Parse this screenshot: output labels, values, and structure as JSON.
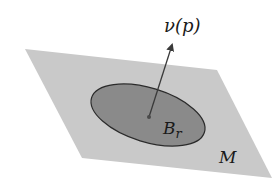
{
  "figure": {
    "type": "tangent-plane-normal-diagram",
    "labels": {
      "normal": "ν(p)",
      "ball_main": "B",
      "ball_sub": "r",
      "manifold": "M"
    },
    "colors": {
      "background": "#ffffff",
      "plane_fill": "#c9c9c9",
      "ball_fill": "#8a8a8a",
      "ball_stroke": "#2b2b2b",
      "arrow": "#3a3a3a",
      "text": "#1a1a1a"
    },
    "elements": {
      "plane": {
        "points": "25,49 217,70 272,178 82,158"
      },
      "ball": {
        "cx": 148,
        "cy": 115,
        "rx": 59,
        "ry": 27,
        "rotate": 17
      },
      "point_p": {
        "cx": 149,
        "cy": 117,
        "r": 2
      },
      "normal_vector": {
        "x1": 149,
        "y1": 117,
        "x2": 172,
        "y2": 45
      }
    }
  }
}
